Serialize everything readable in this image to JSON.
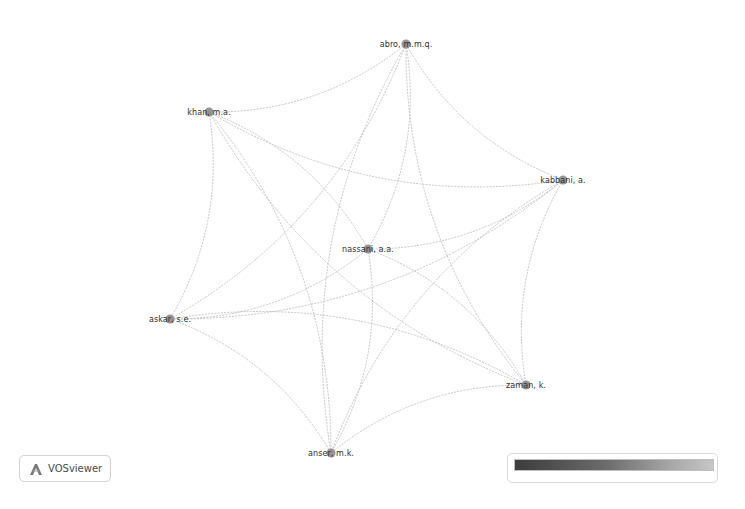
{
  "app": {
    "name": "VOSviewer",
    "logo_icon": "vosviewer-logo-icon"
  },
  "network": {
    "type": "co-authorship network",
    "layout": "circular",
    "nodes": [
      {
        "id": "abro",
        "label": "abro, m.m.q.",
        "x": 406,
        "y": 44
      },
      {
        "id": "khan",
        "label": "khan, m.a.",
        "x": 209,
        "y": 112
      },
      {
        "id": "kabbani",
        "label": "kabbani, a.",
        "x": 563,
        "y": 180
      },
      {
        "id": "nassani",
        "label": "nassani, a.a.",
        "x": 368,
        "y": 249
      },
      {
        "id": "askar",
        "label": "askar, s.e.",
        "x": 170,
        "y": 319
      },
      {
        "id": "zaman",
        "label": "zaman, k.",
        "x": 526,
        "y": 385
      },
      {
        "id": "anser",
        "label": "anser, m.k.",
        "x": 331,
        "y": 453
      }
    ],
    "edges": [
      [
        "abro",
        "khan"
      ],
      [
        "abro",
        "kabbani"
      ],
      [
        "abro",
        "nassani"
      ],
      [
        "abro",
        "askar"
      ],
      [
        "abro",
        "zaman"
      ],
      [
        "abro",
        "anser"
      ],
      [
        "khan",
        "kabbani"
      ],
      [
        "khan",
        "nassani"
      ],
      [
        "khan",
        "askar"
      ],
      [
        "khan",
        "zaman"
      ],
      [
        "khan",
        "anser"
      ],
      [
        "kabbani",
        "nassani"
      ],
      [
        "kabbani",
        "askar"
      ],
      [
        "kabbani",
        "zaman"
      ],
      [
        "kabbani",
        "anser"
      ],
      [
        "nassani",
        "askar"
      ],
      [
        "nassani",
        "zaman"
      ],
      [
        "nassani",
        "anser"
      ],
      [
        "askar",
        "zaman"
      ],
      [
        "askar",
        "anser"
      ],
      [
        "zaman",
        "anser"
      ]
    ],
    "colors": {
      "node": "#8a8a8a",
      "edge": "#bdbdbd",
      "label": "#2f2f2f",
      "background": "#ffffff"
    }
  },
  "color_scale": {
    "gradient_start": "#3c3c3c",
    "gradient_end": "#c6c6c6"
  }
}
